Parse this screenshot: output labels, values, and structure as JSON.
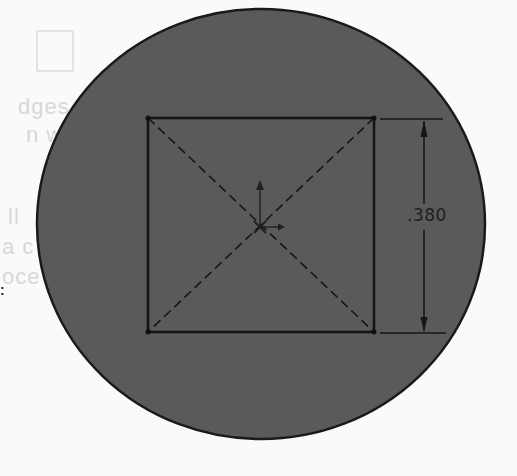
{
  "figure": {
    "background_color": "#fafafa",
    "disc": {
      "fill": "#5a5a5a",
      "stroke": "#1a1a1a",
      "cx": 261,
      "cy": 224,
      "rx": 224,
      "ry": 215
    },
    "square": {
      "x1": 148,
      "y1": 118,
      "x2": 374,
      "y2": 332,
      "stroke": "#151515",
      "diagonals": "dashed"
    },
    "origin": {
      "x": 260,
      "y": 227
    },
    "dimension": {
      "label": ".380",
      "line_x": 424,
      "top_y": 119,
      "bottom_y": 333
    }
  },
  "ghost_text": {
    "line1": "dges",
    "line2": "n w",
    "line3": "ll",
    "line4": "a c",
    "line5": "oce"
  },
  "stray_mark": ":"
}
